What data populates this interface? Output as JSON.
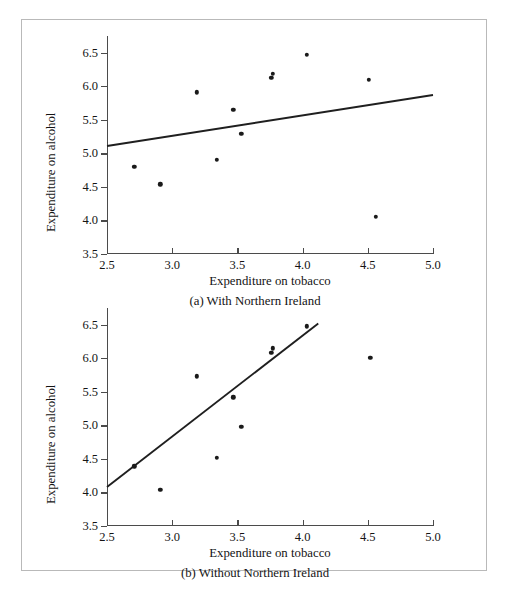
{
  "figure": {
    "panels": [
      {
        "id": "a",
        "caption": "(a) With Northern Ireland",
        "xlabel": "Expenditure on tobacco",
        "ylabel": "Expenditure on alcohol"
      },
      {
        "id": "b",
        "caption": "(b) Without Northern Ireland",
        "xlabel": "Expenditure on tobacco",
        "ylabel": "Expenditure on alcohol"
      }
    ]
  },
  "chart_data": [
    {
      "type": "scatter",
      "title": "(a) With Northern Ireland",
      "xlabel": "Expenditure on tobacco",
      "ylabel": "Expenditure on alcohol",
      "xlim": [
        2.5,
        5.0
      ],
      "ylim": [
        3.5,
        6.75
      ],
      "xticks": [
        "2.5",
        "3.0",
        "3.5",
        "4.0",
        "4.5",
        "5.0"
      ],
      "xtick_values": [
        2.5,
        3.0,
        3.5,
        4.0,
        4.5,
        5.0
      ],
      "yticks": [
        "3.5",
        "4.0",
        "4.5",
        "5.0",
        "5.5",
        "6.0",
        "6.5"
      ],
      "ytick_values": [
        3.5,
        4.0,
        4.5,
        5.0,
        5.5,
        6.0,
        6.5
      ],
      "grid": false,
      "legend": "none",
      "points": [
        {
          "x": 2.71,
          "y": 4.8
        },
        {
          "x": 2.91,
          "y": 4.54
        },
        {
          "x": 3.19,
          "y": 5.91
        },
        {
          "x": 3.34,
          "y": 4.9
        },
        {
          "x": 3.47,
          "y": 5.65
        },
        {
          "x": 3.53,
          "y": 5.29
        },
        {
          "x": 3.76,
          "y": 6.13
        },
        {
          "x": 3.77,
          "y": 6.19
        },
        {
          "x": 4.03,
          "y": 6.47
        },
        {
          "x": 4.51,
          "y": 6.1
        },
        {
          "x": 4.56,
          "y": 4.05
        }
      ],
      "fit_line": {
        "x0": 2.5,
        "y0": 5.11,
        "x1": 5.0,
        "y1": 5.87
      }
    },
    {
      "type": "scatter",
      "title": "(b) Without Northern Ireland",
      "xlabel": "Expenditure on tobacco",
      "ylabel": "Expenditure on alcohol",
      "xlim": [
        2.5,
        5.0
      ],
      "ylim": [
        3.5,
        6.75
      ],
      "xticks": [
        "2.5",
        "3.0",
        "3.5",
        "4.0",
        "4.5",
        "5.0"
      ],
      "xtick_values": [
        2.5,
        3.0,
        3.5,
        4.0,
        4.5,
        5.0
      ],
      "yticks": [
        "3.5",
        "4.0",
        "4.5",
        "5.0",
        "5.5",
        "6.0",
        "6.5"
      ],
      "ytick_values": [
        3.5,
        4.0,
        4.5,
        5.0,
        5.5,
        6.0,
        6.5
      ],
      "grid": false,
      "legend": "none",
      "points": [
        {
          "x": 2.71,
          "y": 4.39
        },
        {
          "x": 2.91,
          "y": 4.04
        },
        {
          "x": 3.19,
          "y": 5.73
        },
        {
          "x": 3.34,
          "y": 4.52
        },
        {
          "x": 3.47,
          "y": 5.42
        },
        {
          "x": 3.53,
          "y": 4.98
        },
        {
          "x": 3.76,
          "y": 6.08
        },
        {
          "x": 3.77,
          "y": 6.15
        },
        {
          "x": 4.03,
          "y": 6.48
        },
        {
          "x": 4.52,
          "y": 6.01
        }
      ],
      "fit_line": {
        "x0": 2.5,
        "y0": 4.08,
        "x1": 4.12,
        "y1": 6.52
      }
    }
  ]
}
